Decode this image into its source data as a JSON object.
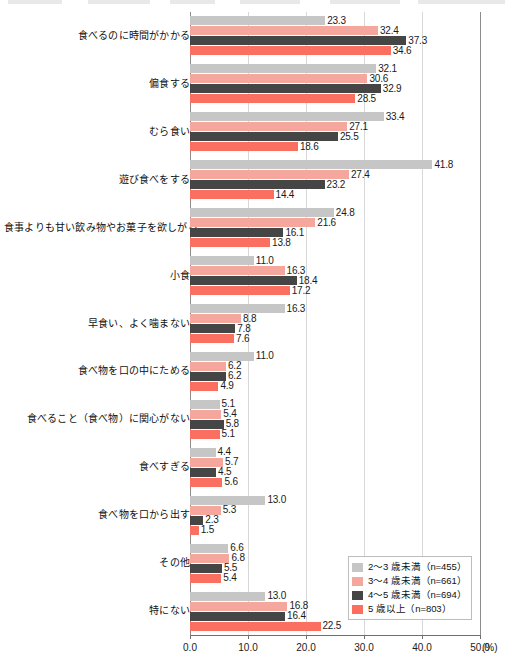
{
  "chart_data": {
    "type": "bar",
    "orientation": "horizontal",
    "title": "",
    "subtitle": "",
    "xlabel": "(%)",
    "ylabel": "",
    "xlim": [
      0.0,
      50.0
    ],
    "xticks": [
      "0.0",
      "10.0",
      "20.0",
      "30.0",
      "40.0",
      "50.0"
    ],
    "xtick_values": [
      0,
      10,
      20,
      30,
      40,
      50
    ],
    "grid": true,
    "legend_position": "bottom-right",
    "unit": "(%)",
    "categories": [
      "食べるのに時間がかかる",
      "偏食する",
      "むら食い",
      "遊び食べをする",
      "食事よりも甘い飲み物やお菓子を欲しがる",
      "小食",
      "早食い、よく噛まない",
      "食べ物を口の中にためる",
      "食べること（食べ物）に関心がない",
      "食べすぎる",
      "食べ物を口から出す",
      "その他",
      "特にない"
    ],
    "series": [
      {
        "name": "2〜3 歳未満（n=455）",
        "label": "2〜3 歳未満",
        "n": "n=455",
        "color": "#c6c6c6",
        "values": [
          23.3,
          32.1,
          33.4,
          41.8,
          24.8,
          11.0,
          16.3,
          11.0,
          5.1,
          4.4,
          13.0,
          6.6,
          13.0
        ]
      },
      {
        "name": "3〜4 歳未満（n=661）",
        "label": "3〜4 歳未満",
        "n": "n=661",
        "color": "#f5a79e",
        "values": [
          32.4,
          30.6,
          27.1,
          27.4,
          21.6,
          16.3,
          8.8,
          6.2,
          5.4,
          5.7,
          5.3,
          6.8,
          16.8
        ]
      },
      {
        "name": "4〜5 歳未満（n=694）",
        "label": "4〜5 歳未満",
        "n": "n=694",
        "color": "#454545",
        "values": [
          37.3,
          32.9,
          25.5,
          23.2,
          16.1,
          18.4,
          7.8,
          6.2,
          5.8,
          4.5,
          2.3,
          5.5,
          16.4
        ]
      },
      {
        "name": "5 歳以上（n=803）",
        "label": "5 歳以上",
        "n": "n=803",
        "color": "#fa6f5f",
        "values": [
          34.6,
          28.5,
          18.6,
          14.4,
          13.8,
          17.2,
          7.6,
          4.9,
          5.1,
          5.6,
          1.5,
          5.4,
          22.5
        ]
      }
    ]
  },
  "legend": {
    "items": [
      {
        "text": "2〜3 歳未満（n=455）",
        "color": "#c6c6c6"
      },
      {
        "text": "3〜4 歳未満（n=661）",
        "color": "#f5a79e"
      },
      {
        "text": "4〜5 歳未満（n=694）",
        "color": "#454545"
      },
      {
        "text": "5 歳以上（n=803）",
        "color": "#fa6f5f"
      }
    ]
  }
}
